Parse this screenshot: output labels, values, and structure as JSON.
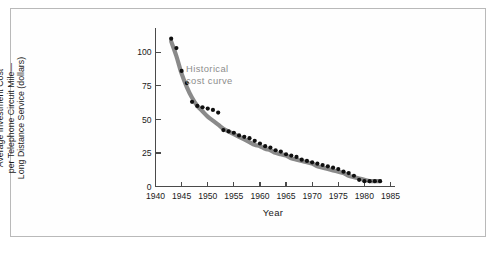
{
  "figure": {
    "background_color": "#ffffff",
    "border_color": "#b9b9b9",
    "curve_color": "#8a8a8a",
    "point_color": "#101010",
    "annotation_color": "#8d8d8d"
  },
  "annotation": {
    "line1": "Historical",
    "line2": "cost curve"
  },
  "axis_titles": {
    "x": "Year",
    "y_line1": "Average Investment Cost",
    "y_line2": "per Telephone Circuit Mile—",
    "y_line3": "Long Distance Service (dollars)"
  },
  "chart_data": {
    "type": "scatter",
    "title": "",
    "subtitle": "",
    "xlabel": "Year",
    "ylabel": "Average Investment Cost per Telephone Circuit Mile—Long Distance Service (dollars)",
    "xlim": [
      1940,
      1985
    ],
    "ylim": [
      0,
      115
    ],
    "xticks": [
      1940,
      1945,
      1950,
      1955,
      1960,
      1965,
      1970,
      1975,
      1980,
      1985
    ],
    "xtick_labels": [
      "1940",
      "1945",
      "1950",
      "1955",
      "1960",
      "1965",
      "1970",
      "1975",
      "1980",
      "1985"
    ],
    "yticks": [
      0,
      25,
      50,
      75,
      100
    ],
    "ytick_labels": [
      "0",
      "25",
      "50",
      "75",
      "100"
    ],
    "grid": false,
    "legend": "none",
    "annotations": [
      {
        "text": "Historical cost curve",
        "x": 1951.5,
        "y": 84,
        "color": "#8d8d8d"
      }
    ],
    "series": [
      {
        "name": "Average investment cost per telephone circuit mile",
        "type": "scatter",
        "marker": "filled-circle",
        "color": "#101010",
        "x": [
          1943,
          1944,
          1945,
          1946,
          1947,
          1948,
          1949,
          1950,
          1951,
          1952,
          1953,
          1954,
          1955,
          1956,
          1957,
          1958,
          1959,
          1960,
          1961,
          1962,
          1963,
          1964,
          1965,
          1966,
          1967,
          1968,
          1969,
          1970,
          1971,
          1972,
          1973,
          1974,
          1975,
          1976,
          1977,
          1978,
          1979,
          1980,
          1981,
          1982,
          1983
        ],
        "y": [
          110,
          103,
          86,
          77,
          63,
          60,
          59,
          58,
          57,
          55,
          42,
          41,
          40,
          38,
          37,
          36,
          34,
          32,
          30,
          29,
          27,
          26,
          24,
          23,
          22,
          20,
          19,
          18,
          17,
          16,
          15,
          14,
          13,
          11,
          10,
          8,
          5,
          4,
          4,
          4,
          4
        ]
      },
      {
        "name": "Historical cost curve",
        "type": "line",
        "color": "#8a8a8a",
        "x": [
          1943,
          1944,
          1945,
          1946,
          1947,
          1948,
          1949,
          1950,
          1951,
          1952,
          1953,
          1954,
          1955,
          1956,
          1957,
          1958,
          1959,
          1960,
          1961,
          1962,
          1963,
          1964,
          1965,
          1966,
          1967,
          1968,
          1969,
          1970,
          1971,
          1972,
          1973,
          1974,
          1975,
          1976,
          1977,
          1978,
          1979,
          1980,
          1981,
          1982,
          1983
        ],
        "y": [
          108,
          97,
          84,
          74,
          66,
          60,
          56,
          52,
          49,
          46,
          43,
          41,
          39,
          37,
          35,
          33,
          31,
          30,
          28,
          27,
          25,
          24,
          23,
          21,
          20,
          19,
          18,
          17,
          15,
          14,
          13,
          12,
          11,
          10,
          8,
          7,
          6,
          5,
          4,
          4,
          4
        ]
      }
    ]
  }
}
